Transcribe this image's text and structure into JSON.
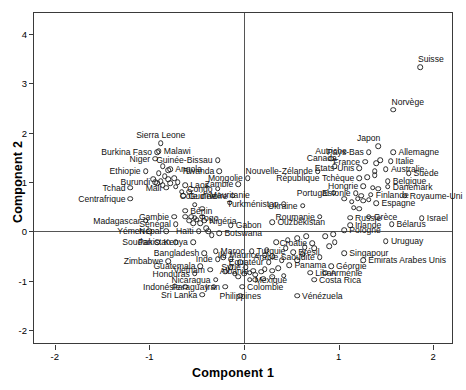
{
  "chart_data": {
    "type": "scatter",
    "title": "",
    "xlabel": "Component 1",
    "ylabel": "Component 2",
    "xlim": [
      -2.22,
      2.22
    ],
    "ylim": [
      -2.3,
      4.42
    ],
    "xticks": [
      -2,
      -1,
      0,
      1,
      2
    ],
    "xticklabels": [
      "-2",
      "-1",
      "0",
      "1",
      "2"
    ],
    "yticks": [
      -2,
      -1,
      0,
      1,
      2,
      3,
      4
    ],
    "yticklabels": [
      "-2",
      "-1",
      "0",
      "1",
      "2",
      "3",
      "4"
    ],
    "grid": false,
    "legend": null,
    "marker": "open-circle",
    "points": [
      {
        "label": "Suisse",
        "x": 1.86,
        "y": 3.32,
        "pos": "above-right"
      },
      {
        "label": "Norvège",
        "x": 1.58,
        "y": 2.46,
        "pos": "above-right"
      },
      {
        "label": "Japon",
        "x": 1.42,
        "y": 1.72,
        "pos": "above-left"
      },
      {
        "label": "Pays-Bas",
        "x": 1.32,
        "y": 1.6,
        "pos": "left"
      },
      {
        "label": "Allemagne",
        "x": 1.58,
        "y": 1.6,
        "pos": "right"
      },
      {
        "label": "Autriche",
        "x": 0.92,
        "y": 1.47,
        "pos": "above"
      },
      {
        "label": "France",
        "x": 1.28,
        "y": 1.41,
        "pos": "left"
      },
      {
        "label": "Italie",
        "x": 1.55,
        "y": 1.42,
        "pos": "right"
      },
      {
        "label": "Canada",
        "x": 0.96,
        "y": 1.32,
        "pos": "above-left"
      },
      {
        "label": "Etats-Unis",
        "x": 1.22,
        "y": 1.28,
        "pos": "left"
      },
      {
        "label": "Australie",
        "x": 1.5,
        "y": 1.26,
        "pos": "right"
      },
      {
        "label": "Nouvelle-Zélande",
        "x": 0.78,
        "y": 1.22,
        "pos": "left"
      },
      {
        "label": "Suède",
        "x": 1.74,
        "y": 1.18,
        "pos": "right"
      },
      {
        "label": "République Tchèque",
        "x": 1.22,
        "y": 1.08,
        "pos": "left"
      },
      {
        "label": "Belgique",
        "x": 1.52,
        "y": 1.02,
        "pos": "right"
      },
      {
        "label": "Hongrie",
        "x": 1.26,
        "y": 0.92,
        "pos": "left"
      },
      {
        "label": "Danemark",
        "x": 1.52,
        "y": 0.9,
        "pos": "right"
      },
      {
        "label": "Mongolie",
        "x": 0.04,
        "y": 1.08,
        "pos": "left"
      },
      {
        "label": "Portugal",
        "x": 0.95,
        "y": 0.78,
        "pos": "left"
      },
      {
        "label": "Estonie",
        "x": 1.18,
        "y": 0.77,
        "pos": "left"
      },
      {
        "label": "Finlande",
        "x": 1.34,
        "y": 0.74,
        "pos": "right"
      },
      {
        "label": "Royaume-Uni",
        "x": 1.7,
        "y": 0.72,
        "pos": "right"
      },
      {
        "label": "Espagne",
        "x": 1.4,
        "y": 0.57,
        "pos": "right"
      },
      {
        "label": "Ukraine",
        "x": 0.62,
        "y": 0.52,
        "pos": "left"
      },
      {
        "label": "Turkménistan",
        "x": 0.42,
        "y": 0.55,
        "pos": "left"
      },
      {
        "label": "Mauritanie",
        "x": -0.15,
        "y": 0.58,
        "pos": "above"
      },
      {
        "label": "Roumanie",
        "x": 0.8,
        "y": 0.3,
        "pos": "left"
      },
      {
        "label": "Russie",
        "x": 1.12,
        "y": 0.28,
        "pos": "right"
      },
      {
        "label": "Grèce",
        "x": 1.32,
        "y": 0.3,
        "pos": "right"
      },
      {
        "label": "Israel",
        "x": 1.88,
        "y": 0.27,
        "pos": "right"
      },
      {
        "label": "Ouzbékistan",
        "x": 0.3,
        "y": 0.18,
        "pos": "right"
      },
      {
        "label": "Irlande",
        "x": 1.12,
        "y": 0.13,
        "pos": "right"
      },
      {
        "label": "Bélarus",
        "x": 1.56,
        "y": 0.14,
        "pos": "right"
      },
      {
        "label": "Pologne",
        "x": 1.06,
        "y": 0.02,
        "pos": "right"
      },
      {
        "label": "Uruguay",
        "x": 1.5,
        "y": -0.2,
        "pos": "right"
      },
      {
        "label": "Croatie",
        "x": 0.72,
        "y": -0.24,
        "pos": "left"
      },
      {
        "label": "Brésil",
        "x": 0.52,
        "y": -0.42,
        "pos": "right"
      },
      {
        "label": "Singapour",
        "x": 1.06,
        "y": -0.44,
        "pos": "right"
      },
      {
        "label": "Arabie Saoudite",
        "x": 0.8,
        "y": -0.52,
        "pos": "left"
      },
      {
        "label": "Emirats Arabes Unis",
        "x": 1.26,
        "y": -0.58,
        "pos": "right"
      },
      {
        "label": "Panama",
        "x": 0.48,
        "y": -0.68,
        "pos": "right"
      },
      {
        "label": "Géorgie",
        "x": 0.92,
        "y": -0.7,
        "pos": "right"
      },
      {
        "label": "Liban",
        "x": 0.7,
        "y": -0.84,
        "pos": "right"
      },
      {
        "label": "Arménie",
        "x": 0.86,
        "y": -0.84,
        "pos": "right"
      },
      {
        "label": "Costa Rica",
        "x": 0.74,
        "y": -0.98,
        "pos": "right"
      },
      {
        "label": "Vénézuela",
        "x": 0.56,
        "y": -1.3,
        "pos": "right"
      },
      {
        "label": "Equateur",
        "x": 0.26,
        "y": -0.62,
        "pos": "left"
      },
      {
        "label": "Ile Maurice",
        "x": 0.22,
        "y": -0.48,
        "pos": "left"
      },
      {
        "label": "Albanie",
        "x": 0.1,
        "y": -0.8,
        "pos": "left"
      },
      {
        "label": "Mexique",
        "x": 0.06,
        "y": -0.98,
        "pos": "right"
      },
      {
        "label": "Colombie",
        "x": -0.02,
        "y": -1.12,
        "pos": "right"
      },
      {
        "label": "Philippines",
        "x": -0.04,
        "y": -1.3,
        "pos": "center"
      },
      {
        "label": "Iran",
        "x": -0.2,
        "y": -1.12,
        "pos": "left"
      },
      {
        "label": "Paraguay",
        "x": -0.32,
        "y": -1.12,
        "pos": "left"
      },
      {
        "label": "Sri Lanka",
        "x": -0.44,
        "y": -1.28,
        "pos": "left"
      },
      {
        "label": "Indonésie",
        "x": -0.62,
        "y": -1.12,
        "pos": "left"
      },
      {
        "label": "Nicaragua",
        "x": -0.3,
        "y": -0.98,
        "pos": "left"
      },
      {
        "label": "Honduras",
        "x": -0.52,
        "y": -0.86,
        "pos": "left"
      },
      {
        "label": "Vietnam",
        "x": -0.36,
        "y": -0.78,
        "pos": "left"
      },
      {
        "label": "Syrie",
        "x": 0.02,
        "y": -0.72,
        "pos": "left"
      },
      {
        "label": "Guatemala",
        "x": -0.46,
        "y": -0.7,
        "pos": "left"
      },
      {
        "label": "Zimbabwe",
        "x": -0.8,
        "y": -0.6,
        "pos": "left"
      },
      {
        "label": "Inde",
        "x": -0.28,
        "y": -0.56,
        "pos": "left"
      },
      {
        "label": "Bangladesh",
        "x": -0.42,
        "y": -0.44,
        "pos": "left"
      },
      {
        "label": "Maroc",
        "x": -0.3,
        "y": -0.4,
        "pos": "right"
      },
      {
        "label": "Turquie",
        "x": 0.08,
        "y": -0.4,
        "pos": "right"
      },
      {
        "label": "Kenya",
        "x": -0.54,
        "y": -0.22,
        "pos": "left"
      },
      {
        "label": "Pakistan",
        "x": -0.72,
        "y": -0.22,
        "pos": "left"
      },
      {
        "label": "Soudan",
        "x": -0.92,
        "y": -0.22,
        "pos": "left"
      },
      {
        "label": "Botswana",
        "x": -0.26,
        "y": -0.04,
        "pos": "right"
      },
      {
        "label": "Gabon",
        "x": -0.14,
        "y": 0.12,
        "pos": "right"
      },
      {
        "label": "Haïti",
        "x": -0.48,
        "y": 0.0,
        "pos": "left"
      },
      {
        "label": "Népal",
        "x": -0.82,
        "y": 0.0,
        "pos": "left"
      },
      {
        "label": "Yémen",
        "x": -1.0,
        "y": 0.0,
        "pos": "left"
      },
      {
        "label": "Nigéria",
        "x": -0.42,
        "y": 0.22,
        "pos": "right"
      },
      {
        "label": "Togo",
        "x": -0.52,
        "y": 0.28,
        "pos": "right"
      },
      {
        "label": "Sénégal",
        "x": -0.72,
        "y": 0.14,
        "pos": "left"
      },
      {
        "label": "Gambie",
        "x": -0.74,
        "y": 0.3,
        "pos": "left"
      },
      {
        "label": "Madagascar",
        "x": -1.04,
        "y": 0.22,
        "pos": "left"
      },
      {
        "label": "Bénin",
        "x": -0.62,
        "y": 0.42,
        "pos": "right"
      },
      {
        "label": "Centrafrique",
        "x": -1.2,
        "y": 0.66,
        "pos": "left"
      },
      {
        "label": "Cote d'Ivoire",
        "x": -0.12,
        "y": 0.72,
        "pos": "left"
      },
      {
        "label": "Congo",
        "x": -0.28,
        "y": 0.86,
        "pos": "left"
      },
      {
        "label": "Guinée",
        "x": -0.64,
        "y": 0.72,
        "pos": "right"
      },
      {
        "label": "Zambie",
        "x": -0.06,
        "y": 0.96,
        "pos": "left"
      },
      {
        "label": "Laos",
        "x": -0.62,
        "y": 0.94,
        "pos": "right"
      },
      {
        "label": "Mali",
        "x": -0.82,
        "y": 0.88,
        "pos": "left"
      },
      {
        "label": "Tchad",
        "x": -1.2,
        "y": 0.88,
        "pos": "left"
      },
      {
        "label": "Burundi",
        "x": -0.94,
        "y": 1.0,
        "pos": "left"
      },
      {
        "label": "Rwanda",
        "x": -0.26,
        "y": 1.22,
        "pos": "left"
      },
      {
        "label": "Guinée-Bissau",
        "x": -0.28,
        "y": 1.44,
        "pos": "left"
      },
      {
        "label": "Angola",
        "x": -0.78,
        "y": 1.26,
        "pos": "right"
      },
      {
        "label": "Ethiopie",
        "x": -1.04,
        "y": 1.22,
        "pos": "left"
      },
      {
        "label": "Niger",
        "x": -0.94,
        "y": 1.47,
        "pos": "left"
      },
      {
        "label": "Burkina Faso",
        "x": -0.92,
        "y": 1.6,
        "pos": "left"
      },
      {
        "label": "Malawi",
        "x": -0.9,
        "y": 1.62,
        "pos": "right"
      },
      {
        "label": "Sierra Leone",
        "x": -0.88,
        "y": 1.78,
        "pos": "above"
      }
    ],
    "extra_points": [
      {
        "x": -0.86,
        "y": 1.32
      },
      {
        "x": -0.8,
        "y": 1.24
      },
      {
        "x": -0.9,
        "y": 1.18
      },
      {
        "x": -0.84,
        "y": 1.12
      },
      {
        "x": -0.96,
        "y": 1.05
      },
      {
        "x": -0.88,
        "y": 1.02
      },
      {
        "x": -0.8,
        "y": 1.06
      },
      {
        "x": -0.92,
        "y": 0.98
      },
      {
        "x": -0.86,
        "y": 0.94
      },
      {
        "x": -0.78,
        "y": 0.98
      },
      {
        "x": -0.74,
        "y": 1.08
      },
      {
        "x": -0.7,
        "y": 1.0
      },
      {
        "x": -0.72,
        "y": 0.9
      },
      {
        "x": -0.66,
        "y": 0.8
      },
      {
        "x": -0.58,
        "y": 0.8
      },
      {
        "x": -0.52,
        "y": 0.54
      },
      {
        "x": -0.44,
        "y": 0.46
      },
      {
        "x": -0.56,
        "y": 0.3
      },
      {
        "x": -0.5,
        "y": 0.24
      },
      {
        "x": -0.44,
        "y": 0.3
      },
      {
        "x": -0.58,
        "y": 0.22
      },
      {
        "x": -0.54,
        "y": 0.16
      },
      {
        "x": -0.46,
        "y": 0.16
      },
      {
        "x": -0.4,
        "y": 0.06
      },
      {
        "x": -0.38,
        "y": 0.0
      },
      {
        "x": -0.34,
        "y": -0.08
      },
      {
        "x": -0.22,
        "y": -0.52
      },
      {
        "x": -0.14,
        "y": -0.56
      },
      {
        "x": -0.14,
        "y": -0.72
      },
      {
        "x": -0.04,
        "y": -0.62
      },
      {
        "x": -0.2,
        "y": -0.82
      },
      {
        "x": -0.1,
        "y": -0.86
      },
      {
        "x": -0.06,
        "y": -0.92
      },
      {
        "x": 0.0,
        "y": -0.86
      },
      {
        "x": 0.06,
        "y": -0.84
      },
      {
        "x": 0.12,
        "y": -0.88
      },
      {
        "x": 0.18,
        "y": -0.82
      },
      {
        "x": 0.22,
        "y": -0.76
      },
      {
        "x": 0.3,
        "y": -0.8
      },
      {
        "x": 0.36,
        "y": -0.74
      },
      {
        "x": 0.12,
        "y": -0.98
      },
      {
        "x": 0.2,
        "y": -0.96
      },
      {
        "x": 0.3,
        "y": -0.92
      },
      {
        "x": 0.42,
        "y": -0.9
      },
      {
        "x": 0.56,
        "y": -0.58
      },
      {
        "x": 0.62,
        "y": -0.46
      },
      {
        "x": 0.64,
        "y": -0.32
      },
      {
        "x": 0.74,
        "y": -0.34
      },
      {
        "x": 0.9,
        "y": -0.3
      },
      {
        "x": 0.96,
        "y": -0.22
      },
      {
        "x": 0.86,
        "y": -0.1
      },
      {
        "x": 0.94,
        "y": -0.06
      },
      {
        "x": 0.66,
        "y": -0.1
      },
      {
        "x": 0.56,
        "y": -0.14
      },
      {
        "x": 0.46,
        "y": -0.18
      },
      {
        "x": 0.34,
        "y": -0.22
      },
      {
        "x": 0.44,
        "y": -0.34
      },
      {
        "x": 0.24,
        "y": -0.38
      },
      {
        "x": 0.3,
        "y": -0.5
      },
      {
        "x": 0.4,
        "y": -0.58
      },
      {
        "x": 1.16,
        "y": 0.48
      },
      {
        "x": 1.22,
        "y": 0.46
      },
      {
        "x": 1.26,
        "y": 0.62
      },
      {
        "x": 1.32,
        "y": 0.64
      },
      {
        "x": 1.2,
        "y": 0.66
      },
      {
        "x": 1.24,
        "y": 0.72
      },
      {
        "x": 1.14,
        "y": 0.6
      },
      {
        "x": 1.06,
        "y": 0.66
      },
      {
        "x": 1.36,
        "y": 0.88
      },
      {
        "x": 1.42,
        "y": 0.86
      },
      {
        "x": 1.3,
        "y": 1.1
      },
      {
        "x": 1.38,
        "y": 1.14
      },
      {
        "x": 1.38,
        "y": 1.22
      },
      {
        "x": 1.4,
        "y": 1.38
      },
      {
        "x": 1.44,
        "y": 1.44
      },
      {
        "x": -0.62,
        "y": 0.3
      }
    ]
  }
}
